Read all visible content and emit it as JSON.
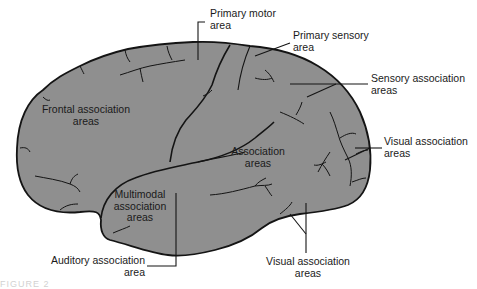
{
  "figure": {
    "colors": {
      "background": "#ffffff",
      "brain_fill": "#8f8f8f",
      "outline": "#141414",
      "text": "#1a1a1a"
    }
  },
  "labels": {
    "primary_motor": {
      "line1": "Primary motor",
      "line2": "area"
    },
    "primary_sensory": {
      "line1": "Primary sensory",
      "line2": "area"
    },
    "sensory_association": {
      "line1": "Sensory association",
      "line2": "areas"
    },
    "visual_association_right": {
      "line1": "Visual association",
      "line2": "areas"
    },
    "frontal_association": {
      "line1": "Frontal association",
      "line2": "areas"
    },
    "association": {
      "line1": "Association",
      "line2": "areas"
    },
    "multimodal_association": {
      "line1": "Multimodal",
      "line2": "association",
      "line3": "areas"
    },
    "auditory_association": {
      "line1": "Auditory association",
      "line2": "area"
    },
    "visual_association_bottom": {
      "line1": "Visual association",
      "line2": "areas"
    }
  },
  "caption": {
    "text": "FIGURE 2"
  }
}
